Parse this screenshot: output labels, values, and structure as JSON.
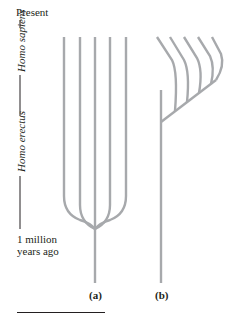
{
  "axis": {
    "top_label": "Present",
    "bottom_label": "1 million years ago",
    "bottom_label_line1": "1 million",
    "bottom_label_line2": "years ago",
    "segments": [
      {
        "label": "Homo sapiens",
        "range": "present to ~Homo erectus transition"
      },
      {
        "label": "Homo erectus",
        "range": "to 1 million years ago"
      }
    ]
  },
  "panels": [
    {
      "id": "a",
      "label": "(a)",
      "model": "five lineages branching from a common stem ~1 million years ago and evolving in parallel to the present",
      "branch_count": 5
    },
    {
      "id": "b",
      "label": "(b)",
      "model": "single stem with a recent branch that radiates into five lineages",
      "branch_count": 5
    }
  ],
  "colors": {
    "branch": "#a7a9ac",
    "text": "#231f20"
  }
}
